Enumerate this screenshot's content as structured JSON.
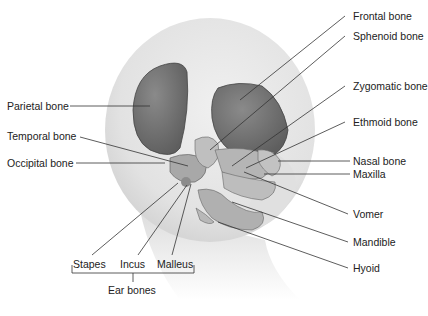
{
  "diagram": {
    "labels": {
      "frontal": "Frontal bone",
      "sphenoid": "Sphenoid bone",
      "zygomatic": "Zygomatic bone",
      "ethmoid": "Ethmoid bone",
      "nasal": "Nasal bone",
      "maxilla": "Maxilla",
      "vomer": "Vomer",
      "mandible": "Mandible",
      "hyoid": "Hyoid",
      "parietal": "Parietal bone",
      "temporal": "Temporal bone",
      "occipital": "Occipital bone",
      "stapes": "Stapes",
      "incus": "Incus",
      "malleus": "Malleus",
      "ear_bones": "Ear bones"
    },
    "colors": {
      "head": "#e6e6e6",
      "bone_dark": "#6f6f6f",
      "bone_light": "#bdbdbd",
      "leader_line": "#333333"
    }
  }
}
